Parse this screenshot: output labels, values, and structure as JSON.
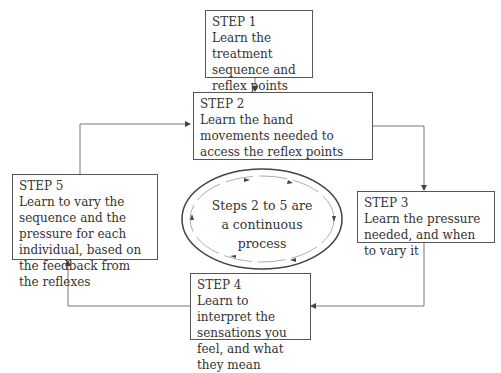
{
  "diagram": {
    "steps": [
      {
        "title": "STEP 1",
        "text": "Learn the treatment sequence and reflex points"
      },
      {
        "title": "STEP 2",
        "text": "Learn the hand movements needed to access the reflex points"
      },
      {
        "title": "STEP 3",
        "text": "Learn the pressure needed, and when to vary it"
      },
      {
        "title": "STEP 4",
        "text": "Learn to interpret the sensations you feel, and what they mean"
      },
      {
        "title": "STEP 5",
        "text": "Learn to vary the sequence and the pressure for each individual, based on the feedback from the reflexes"
      }
    ],
    "cycle_label": "Steps 2 to 5 are a continuous process",
    "colors": {
      "line": "#555555",
      "box_border": "#555555",
      "text": "#333333"
    }
  }
}
